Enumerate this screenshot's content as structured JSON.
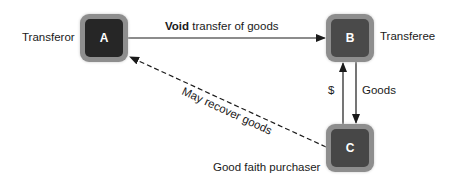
{
  "nodes": {
    "a": {
      "letter": "A",
      "label": "Transferor",
      "fill": "#262626"
    },
    "b": {
      "letter": "B",
      "label": "Transferee",
      "fill": "#4a4a4a"
    },
    "c": {
      "letter": "C",
      "label": "Good faith purchaser",
      "fill": "#474747"
    }
  },
  "edges": {
    "a_to_b": {
      "bold": "Void",
      "rest": " transfer of goods",
      "style": "solid"
    },
    "c_to_b": {
      "label": "$",
      "style": "solid"
    },
    "b_to_c": {
      "label": "Goods",
      "style": "solid"
    },
    "c_to_a": {
      "label": "May recover goods",
      "style": "dashed"
    }
  }
}
